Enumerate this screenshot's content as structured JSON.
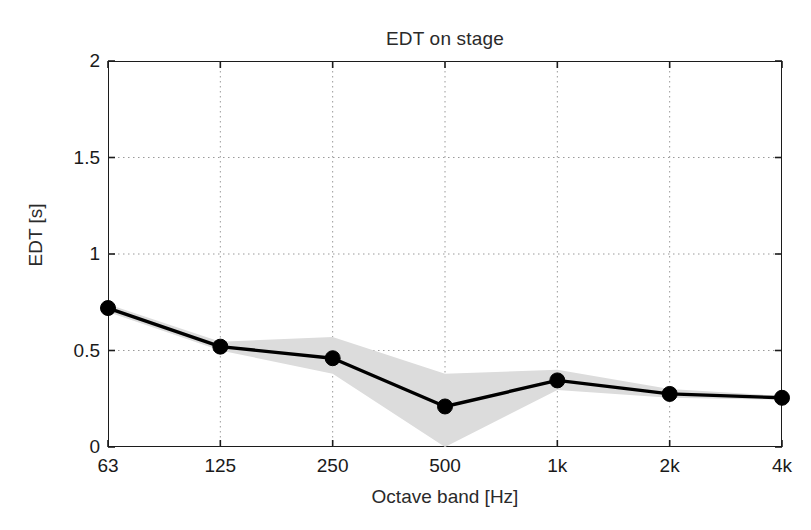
{
  "chart_data": {
    "type": "line",
    "title": "EDT on stage",
    "xlabel": "Octave band [Hz]",
    "ylabel": "EDT [s]",
    "categories": [
      "63",
      "125",
      "250",
      "500",
      "1k",
      "2k",
      "4k"
    ],
    "values": [
      0.72,
      0.52,
      0.46,
      0.21,
      0.345,
      0.275,
      0.255
    ],
    "band_upper": [
      0.74,
      0.545,
      0.57,
      0.38,
      0.4,
      0.3,
      0.265
    ],
    "band_lower": [
      0.7,
      0.5,
      0.38,
      0.0,
      0.295,
      0.255,
      0.245
    ],
    "ylim": [
      0,
      2
    ],
    "yticks": [
      0,
      0.5,
      1,
      1.5,
      2
    ],
    "ytick_labels": [
      "0",
      "0.5",
      "1",
      "1.5",
      "2"
    ],
    "grid": "dotted",
    "legend": "none",
    "series": [
      {
        "name": "EDT mean",
        "values": [
          0.72,
          0.52,
          0.46,
          0.21,
          0.345,
          0.275,
          0.255
        ],
        "marker": "filled-circle",
        "color": "#000000"
      },
      {
        "name": "EDT spread band",
        "upper": [
          0.74,
          0.545,
          0.57,
          0.38,
          0.4,
          0.3,
          0.265
        ],
        "lower": [
          0.7,
          0.5,
          0.38,
          0.0,
          0.295,
          0.255,
          0.245
        ],
        "color": "#d9d9d9"
      }
    ]
  },
  "style": {
    "line_color": "#000000",
    "band_color": "#dcdcdc",
    "grid_color": "#9a9a9a",
    "axis_color": "#1c1c1c",
    "background": "#ffffff"
  }
}
